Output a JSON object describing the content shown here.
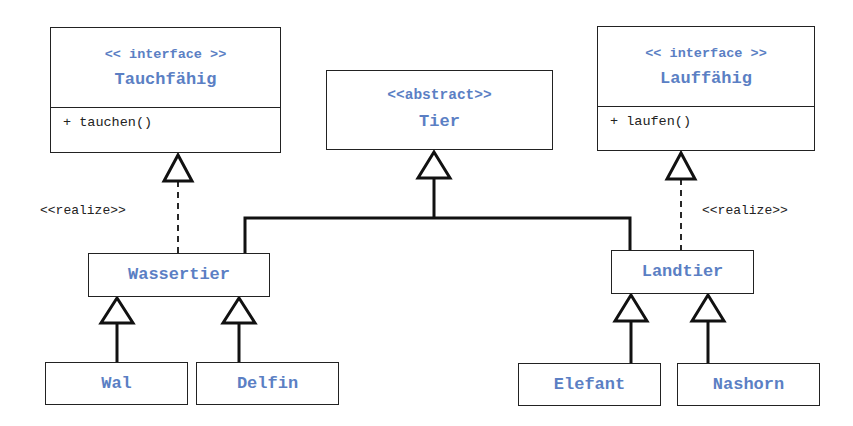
{
  "diagram": {
    "type": "uml-class-diagram",
    "colors": {
      "class_name": "#5b7fc4",
      "lines": "#111111",
      "text": "#222222"
    },
    "classes": {
      "tauchfaehig": {
        "stereotype": "<< interface >>",
        "name": "Tauchfähig",
        "operations": [
          "+ tauchen()"
        ]
      },
      "tier": {
        "stereotype": "<<abstract>>",
        "name": "Tier"
      },
      "lauffaehig": {
        "stereotype": "<< interface >>",
        "name": "Lauffähig",
        "operations": [
          "+ laufen()"
        ]
      },
      "wassertier": {
        "name": "Wassertier"
      },
      "landtier": {
        "name": "Landtier"
      },
      "wal": {
        "name": "Wal"
      },
      "delfin": {
        "name": "Delfin"
      },
      "elefant": {
        "name": "Elefant"
      },
      "nashorn": {
        "name": "Nashorn"
      }
    },
    "relations": [
      {
        "from": "Wassertier",
        "to": "Tauchfähig",
        "kind": "realization",
        "label": "<<realize>>"
      },
      {
        "from": "Landtier",
        "to": "Lauffähig",
        "kind": "realization",
        "label": "<<realize>>"
      },
      {
        "from": "Wassertier",
        "to": "Tier",
        "kind": "generalization"
      },
      {
        "from": "Landtier",
        "to": "Tier",
        "kind": "generalization"
      },
      {
        "from": "Wal",
        "to": "Wassertier",
        "kind": "generalization"
      },
      {
        "from": "Delfin",
        "to": "Wassertier",
        "kind": "generalization"
      },
      {
        "from": "Elefant",
        "to": "Landtier",
        "kind": "generalization"
      },
      {
        "from": "Nashorn",
        "to": "Landtier",
        "kind": "generalization"
      }
    ],
    "labels": {
      "realize_left": "<<realize>>",
      "realize_right": "<<realize>>"
    }
  }
}
